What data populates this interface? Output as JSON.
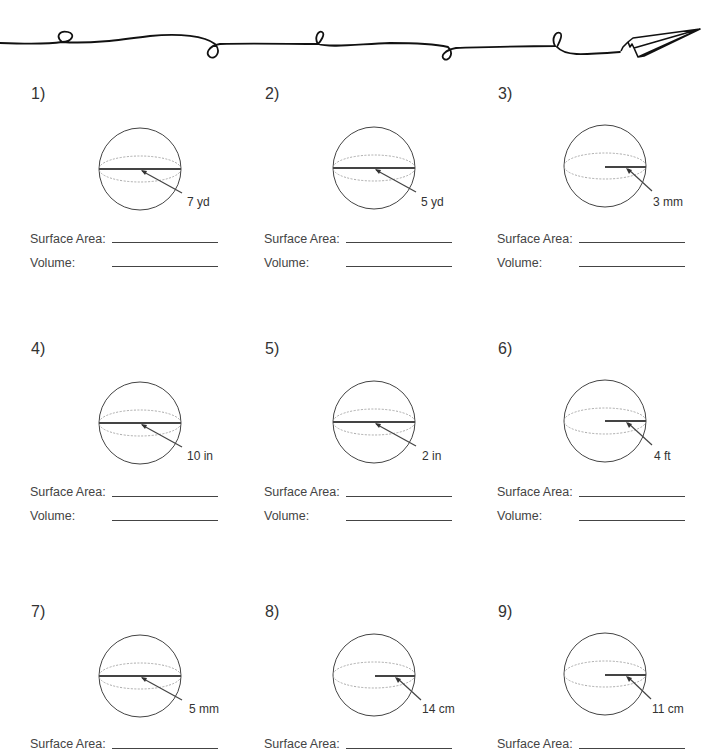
{
  "worksheet": {
    "problems": [
      {
        "number": "1)",
        "measure": "7 yd",
        "line_type": "diameter",
        "surface_area_label": "Surface Area:",
        "volume_label": "Volume:"
      },
      {
        "number": "2)",
        "measure": "5 yd",
        "line_type": "diameter",
        "surface_area_label": "Surface Area:",
        "volume_label": "Volume:"
      },
      {
        "number": "3)",
        "measure": "3 mm",
        "line_type": "radius",
        "surface_area_label": "Surface Area:",
        "volume_label": "Volume:"
      },
      {
        "number": "4)",
        "measure": "10 in",
        "line_type": "diameter",
        "surface_area_label": "Surface Area:",
        "volume_label": "Volume:"
      },
      {
        "number": "5)",
        "measure": "2 in",
        "line_type": "diameter",
        "surface_area_label": "Surface Area:",
        "volume_label": "Volume:"
      },
      {
        "number": "6)",
        "measure": "4 ft",
        "line_type": "radius",
        "surface_area_label": "Surface Area:",
        "volume_label": "Volume:"
      },
      {
        "number": "7)",
        "measure": "5 mm",
        "line_type": "diameter",
        "surface_area_label": "Surface Area:",
        "volume_label": ""
      },
      {
        "number": "8)",
        "measure": "14 cm",
        "line_type": "radius",
        "surface_area_label": "Surface Area:",
        "volume_label": ""
      },
      {
        "number": "9)",
        "measure": "11 cm",
        "line_type": "radius",
        "surface_area_label": "Surface Area:",
        "volume_label": ""
      }
    ]
  },
  "icons": {
    "divider": "squiggle-line-with-paper-airplane",
    "figure": "sphere-icon"
  },
  "colors": {
    "ink": "#333333",
    "dotted": "#aaaaaa"
  }
}
